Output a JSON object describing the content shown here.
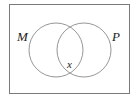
{
  "diagram": {
    "type": "venn",
    "sets": [
      {
        "label": "M"
      },
      {
        "label": "P"
      }
    ],
    "intersection_label": "x",
    "colors": {
      "stroke": "#8a8a8a",
      "frame": "#7a7a7a",
      "text": "#222222"
    }
  }
}
